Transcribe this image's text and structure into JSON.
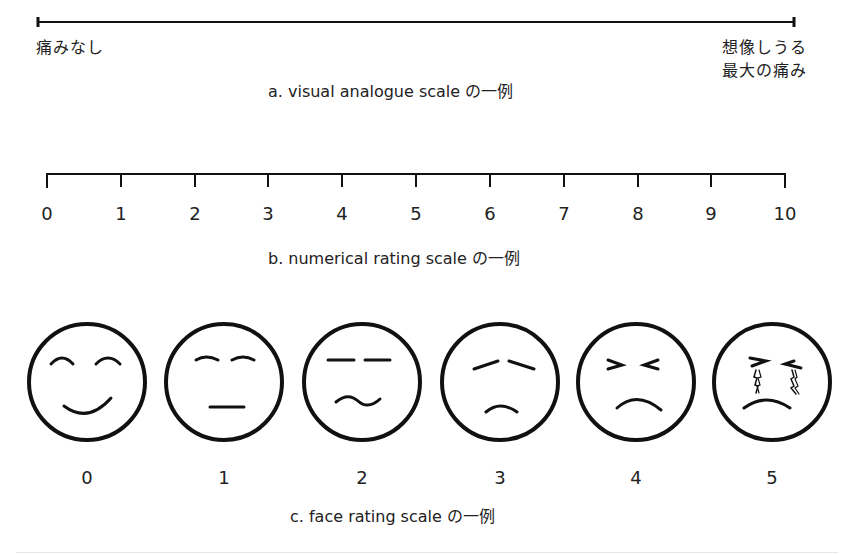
{
  "vas": {
    "left_label": "痛みなし",
    "right_label_line1": "想像しうる",
    "right_label_line2": "最大の痛み",
    "caption": "a.  visual analogue scale の一例"
  },
  "nrs": {
    "ticks": [
      "0",
      "1",
      "2",
      "3",
      "4",
      "5",
      "6",
      "7",
      "8",
      "9",
      "10"
    ],
    "caption": "b.  numerical rating scale の一例"
  },
  "frs": {
    "faces": [
      {
        "score": "0",
        "expression": "smiling"
      },
      {
        "score": "1",
        "expression": "neutral"
      },
      {
        "score": "2",
        "expression": "slightly-uneasy"
      },
      {
        "score": "3",
        "expression": "sad"
      },
      {
        "score": "4",
        "expression": "grimacing"
      },
      {
        "score": "5",
        "expression": "crying"
      }
    ],
    "caption": "c.  face rating scale の一例"
  },
  "colors": {
    "ink": "#111111",
    "text": "#222222",
    "background": "#ffffff"
  }
}
